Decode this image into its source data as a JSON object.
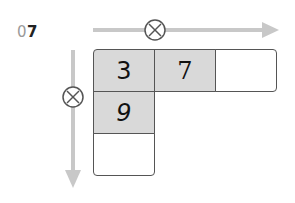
{
  "problem_label": {
    "prefix": "0",
    "number": "7"
  },
  "operation_symbol": "×",
  "colors": {
    "cell_filled": "#d9d9d9",
    "arrow": "#c8c8c8",
    "border": "#555555"
  },
  "row_cells": [
    {
      "value": "3",
      "filled": true
    },
    {
      "value": "7",
      "filled": true
    },
    {
      "value": "",
      "filled": false
    }
  ],
  "column_cells": [
    {
      "value": "9",
      "filled": true
    },
    {
      "value": "",
      "filled": false
    }
  ]
}
